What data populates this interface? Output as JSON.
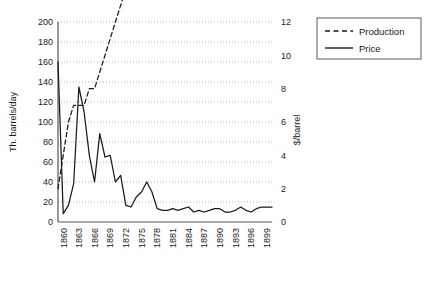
{
  "chart_data": {
    "type": "line",
    "title": "",
    "xlabel": "",
    "ylabel": "Th. barrels/day",
    "y2label": "$/barrel",
    "grid": true,
    "legend_position": "right",
    "ylim": [
      0,
      200
    ],
    "y2lim": [
      0,
      12
    ],
    "xlim": [
      1859,
      1900
    ],
    "yticks": [
      0,
      20,
      40,
      60,
      80,
      100,
      120,
      140,
      160,
      180,
      200
    ],
    "y2ticks": [
      0,
      2,
      4,
      6,
      8,
      10,
      12
    ],
    "xticks": [
      1860,
      1863,
      1866,
      1869,
      1872,
      1875,
      1878,
      1881,
      1884,
      1887,
      1890,
      1893,
      1896,
      1899
    ],
    "x": [
      1859,
      1860,
      1861,
      1862,
      1863,
      1864,
      1865,
      1866,
      1867,
      1868,
      1869,
      1870,
      1871,
      1872,
      1873,
      1874,
      1875,
      1876,
      1877,
      1878,
      1879,
      1880,
      1881,
      1882,
      1883,
      1884,
      1885,
      1886,
      1887,
      1888,
      1889,
      1890,
      1891,
      1892,
      1893,
      1894,
      1895,
      1896,
      1897,
      1898,
      1899,
      1900
    ],
    "series": [
      {
        "name": "Production",
        "axis": "right",
        "style": "dashed",
        "color": "#1a1a1a",
        "units": "Th. barrels/day",
        "values": [
          2,
          4,
          6,
          7,
          7,
          7,
          8,
          8,
          9,
          10,
          11,
          12,
          13,
          14,
          15,
          16,
          18,
          20,
          19,
          21,
          22,
          26,
          27,
          36,
          39,
          40,
          38,
          39,
          48,
          62,
          75,
          78,
          78,
          74,
          66,
          62,
          68,
          72,
          80,
          72,
          76,
          82
        ]
      },
      {
        "name": "Price",
        "axis": "right",
        "style": "solid",
        "color": "#1a1a1a",
        "units": "$/barrel",
        "values": [
          9.6,
          0.5,
          1.0,
          2.3,
          8.1,
          6.6,
          4.0,
          2.4,
          5.3,
          3.9,
          4.0,
          2.4,
          2.8,
          1.0,
          0.9,
          1.5,
          1.8,
          2.4,
          1.8,
          0.8,
          0.7,
          0.7,
          0.8,
          0.7,
          0.8,
          0.9,
          0.6,
          0.7,
          0.6,
          0.7,
          0.8,
          0.8,
          0.6,
          0.6,
          0.7,
          0.9,
          0.7,
          0.6,
          0.8,
          0.9,
          0.9,
          0.9
        ]
      }
    ]
  },
  "axes": {
    "left_title": "Th. barrels/day",
    "right_title": "$/barrel",
    "left_ticks": [
      "200",
      "180",
      "160",
      "140",
      "120",
      "100",
      "80",
      "60",
      "40",
      "20",
      "0"
    ],
    "right_ticks": [
      "12",
      "10",
      "8",
      "6",
      "4",
      "2",
      "0"
    ],
    "x_ticks": [
      "1860",
      "1863",
      "1866",
      "1869",
      "1872",
      "1875",
      "1878",
      "1881",
      "1884",
      "1887",
      "1890",
      "1893",
      "1896",
      "1899"
    ]
  },
  "legend": {
    "items": [
      {
        "label": "Production",
        "style": "dashed"
      },
      {
        "label": "Price",
        "style": "solid"
      }
    ]
  }
}
